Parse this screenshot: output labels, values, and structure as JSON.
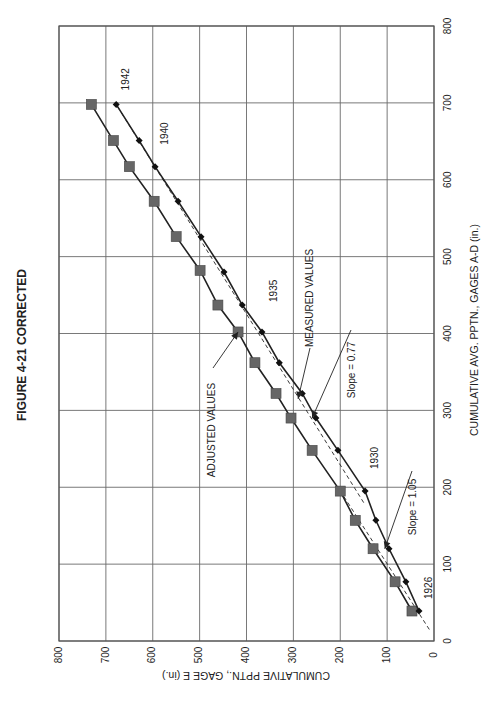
{
  "figure": {
    "title": "FIGURE 4-21 CORRECTED",
    "orientation": "rotated 90° clockwise on page"
  },
  "chart_data": {
    "type": "line",
    "title": "FIGURE 4-21 CORRECTED",
    "xlabel": "CUMULATIVE AVG. PPTN., GAGES A-D (in.)",
    "ylabel": "CUMULATIVE  PPTN., GAGE E (in.)",
    "xlim": [
      0,
      800
    ],
    "ylim": [
      0,
      800
    ],
    "xticks": [
      0,
      100,
      200,
      300,
      400,
      500,
      600,
      700,
      800
    ],
    "yticks": [
      0,
      100,
      200,
      300,
      400,
      500,
      600,
      700,
      800
    ],
    "grid": true,
    "series": [
      {
        "name": "ADJUSTED VALUES",
        "marker": "square",
        "color": "#666666",
        "x": [
          39,
          77,
          120,
          157,
          195,
          248,
          290,
          322,
          362,
          402,
          437,
          482,
          526,
          572,
          617,
          651,
          698
        ],
        "y": [
          47,
          83,
          130,
          168,
          200,
          260,
          305,
          337,
          382,
          418,
          461,
          499,
          550,
          597,
          650,
          684,
          731
        ]
      },
      {
        "name": "MEASURED VALUES",
        "marker": "diamond",
        "color": "#111111",
        "x": [
          39,
          77,
          120,
          157,
          195,
          248,
          290,
          322,
          362,
          402,
          437,
          480,
          526,
          572,
          617,
          651,
          698
        ],
        "y": [
          32,
          60,
          96,
          124,
          147,
          205,
          252,
          281,
          330,
          367,
          409,
          448,
          497,
          546,
          595,
          629,
          678
        ]
      }
    ],
    "trend_lines": [
      {
        "label": "Slope = 1.05",
        "style": "dashed",
        "from": [
          15,
          10
        ],
        "to": [
          200,
          205
        ]
      },
      {
        "label": "Slope = 0.77",
        "style": "dashed",
        "from": [
          180,
          150
        ],
        "to": [
          700,
          680
        ]
      }
    ],
    "annotations": [
      {
        "text": "1926",
        "at": [
          39,
          32
        ]
      },
      {
        "text": "1930",
        "at": [
          195,
          147
        ]
      },
      {
        "text": "1935",
        "at": [
          402,
          367
        ]
      },
      {
        "text": "1940",
        "at": [
          617,
          595
        ]
      },
      {
        "text": "1942",
        "at": [
          698,
          678
        ]
      },
      {
        "text": "ADJUSTED VALUES",
        "arrow_to": [
          402,
          418
        ]
      },
      {
        "text": "MEASURED VALUES",
        "arrow_to": [
          315,
          290
        ]
      },
      {
        "text": "Slope = 1.05",
        "arrow_to": [
          120,
          105
        ]
      },
      {
        "text": "Slope = 0.77",
        "arrow_to": [
          290,
          260
        ]
      }
    ],
    "legend": "none (inline labels)"
  }
}
